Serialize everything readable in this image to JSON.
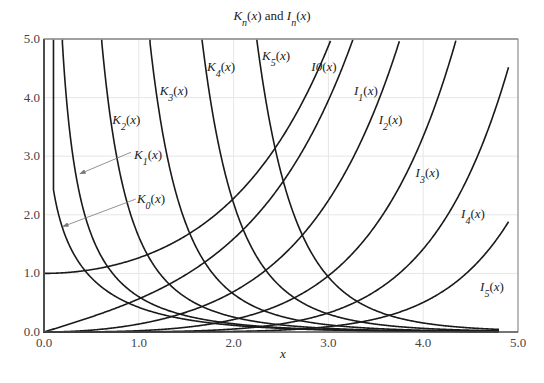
{
  "chart_data": {
    "type": "line",
    "title_parts": {
      "K": "K",
      "n": "n",
      "mid": "(x) and ",
      "I": "I",
      "end": "(x)"
    },
    "xlabel": "x",
    "ylabel": "",
    "xlim": [
      0,
      5
    ],
    "ylim": [
      0,
      5
    ],
    "xticks": [
      0,
      1,
      2,
      3,
      4,
      5
    ],
    "xtick_labels": [
      "0.0",
      "1.0",
      "2.0",
      "3.0",
      "4.0",
      "5.0"
    ],
    "yticks": [
      0,
      1,
      2,
      3,
      4,
      5
    ],
    "ytick_labels": [
      "0.0",
      "1.0",
      "2.0",
      "3.0",
      "4.0",
      "5.0"
    ],
    "grid": true,
    "x_range_plotted": [
      0.1,
      4.8
    ],
    "series": [
      {
        "name": "K0(x)",
        "kind": "K",
        "order": 0,
        "label_base": "K",
        "label_sub": "0",
        "label_tail": "(x)",
        "x_end": 4.8
      },
      {
        "name": "K1(x)",
        "kind": "K",
        "order": 1,
        "label_base": "K",
        "label_sub": "1",
        "label_tail": "(x)",
        "x_end": 4.8
      },
      {
        "name": "K2(x)",
        "kind": "K",
        "order": 2,
        "label_base": "K",
        "label_sub": "2",
        "label_tail": "(x)",
        "x_end": 4.8
      },
      {
        "name": "K3(x)",
        "kind": "K",
        "order": 3,
        "label_base": "K",
        "label_sub": "3",
        "label_tail": "(x)",
        "x_end": 4.8
      },
      {
        "name": "K4(x)",
        "kind": "K",
        "order": 4,
        "label_base": "K",
        "label_sub": "4",
        "label_tail": "(x)",
        "x_end": 4.8
      },
      {
        "name": "K5(x)",
        "kind": "K",
        "order": 5,
        "label_base": "K",
        "label_sub": "5",
        "label_tail": "(x)",
        "x_end": 4.8
      },
      {
        "name": "I0(x)",
        "kind": "I",
        "order": 0,
        "label_base": "I0",
        "label_sub": "",
        "label_tail": "(x)",
        "x_end": 4.9
      },
      {
        "name": "I1(x)",
        "kind": "I",
        "order": 1,
        "label_base": "I",
        "label_sub": "1",
        "label_tail": "(x)",
        "x_end": 4.9
      },
      {
        "name": "I2(x)",
        "kind": "I",
        "order": 2,
        "label_base": "I",
        "label_sub": "2",
        "label_tail": "(x)",
        "x_end": 4.9
      },
      {
        "name": "I3(x)",
        "kind": "I",
        "order": 3,
        "label_base": "I",
        "label_sub": "3",
        "label_tail": "(x)",
        "x_end": 4.9
      },
      {
        "name": "I4(x)",
        "kind": "I",
        "order": 4,
        "label_base": "I",
        "label_sub": "4",
        "label_tail": "(x)",
        "x_end": 4.9
      },
      {
        "name": "I5(x)",
        "kind": "I",
        "order": 5,
        "label_base": "I",
        "label_sub": "5",
        "label_tail": "(x)",
        "x_end": 4.9
      }
    ],
    "annotations": [
      {
        "text": "K0(x)",
        "arrow_to_series": "K0(x)",
        "arrow_to": [
          0.2,
          1.8
        ],
        "label_at": [
          1.0,
          2.2
        ]
      },
      {
        "text": "K1(x)",
        "arrow_to_series": "K1(x)",
        "arrow_to": [
          0.38,
          2.7
        ],
        "label_at": [
          0.95,
          3.0
        ]
      }
    ],
    "label_positions": {
      "K0(x)": [
        0.98,
        2.2
      ],
      "K1(x)": [
        0.95,
        2.95
      ],
      "K2(x)": [
        0.72,
        3.55
      ],
      "K3(x)": [
        1.22,
        4.05
      ],
      "K4(x)": [
        1.72,
        4.45
      ],
      "K5(x)": [
        2.3,
        4.65
      ],
      "I0(x)": [
        2.82,
        4.45
      ],
      "I1(x)": [
        3.27,
        4.05
      ],
      "I2(x)": [
        3.53,
        3.55
      ],
      "I3(x)": [
        3.92,
        2.65
      ],
      "I4(x)": [
        4.4,
        1.95
      ],
      "I5(x)": [
        4.6,
        0.7
      ]
    }
  }
}
